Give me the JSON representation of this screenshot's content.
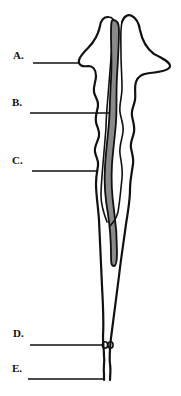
{
  "figure": {
    "labels": [
      {
        "id": "A",
        "text": "A.",
        "x": 13,
        "y": 50
      },
      {
        "id": "B",
        "text": "B.",
        "x": 12,
        "y": 97
      },
      {
        "id": "C",
        "text": "C.",
        "x": 12,
        "y": 155
      },
      {
        "id": "D",
        "text": "D.",
        "x": 13,
        "y": 328
      },
      {
        "id": "E",
        "text": "E.",
        "x": 12,
        "y": 363
      }
    ],
    "colors": {
      "outline": "#111111",
      "shaded_structure": "#8a8a8a",
      "background": "#ffffff"
    }
  }
}
